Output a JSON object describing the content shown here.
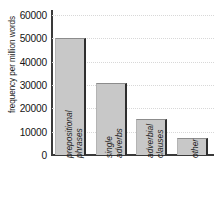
{
  "chart_data": {
    "type": "bar",
    "title": "",
    "xlabel": "",
    "ylabel": "frequency per million words",
    "categories": [
      "prepositional phrases",
      "single adverbs",
      "adverbial clauses",
      "other"
    ],
    "category_lines": [
      [
        "prepositional",
        "phrases"
      ],
      [
        "single",
        "adverbs"
      ],
      [
        "adverbial",
        "clauses"
      ],
      [
        "other"
      ]
    ],
    "values": [
      50000,
      30700,
      15450,
      7300
    ],
    "ylim": [
      0,
      60000
    ],
    "ytick_step": 10000,
    "yticks": [
      0,
      10000,
      20000,
      30000,
      40000,
      50000,
      60000
    ],
    "ytick_labels": [
      "0",
      "10000",
      "20000",
      "30000",
      "40000",
      "50000",
      "60000"
    ],
    "grid": true,
    "grid_axis": "y",
    "grid_style": "dotted",
    "legend": false,
    "legend_position": "none",
    "bar_fill_color": "#c8c8c8",
    "bar_edge_color": "#2e2e2e",
    "axis_color": "#3a3a3a",
    "grid_color": "#d8d8d8",
    "text_color": "#1c1c1c",
    "background_color": "#ffffff",
    "xlabel_rotation": 90,
    "xlabel_italic": true
  }
}
